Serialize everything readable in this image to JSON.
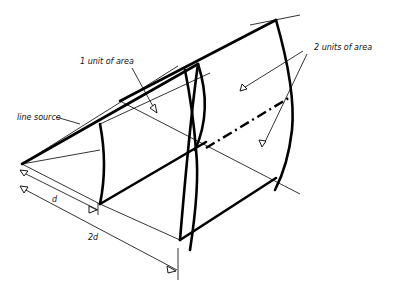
{
  "diagram": {
    "labels": {
      "one_unit": "1 unit of area",
      "two_units": "2 units of area",
      "line_source": "line source",
      "d": "d",
      "two_d": "2d"
    },
    "colors": {
      "ink": "#000000",
      "background": "#ffffff"
    }
  }
}
